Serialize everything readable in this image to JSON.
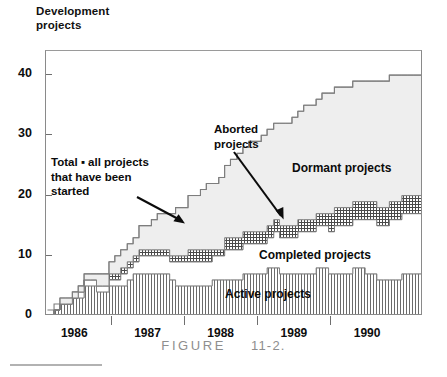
{
  "axis_title": "Development\nprojects",
  "caption": {
    "word": "FIGURE",
    "number": "11-2."
  },
  "annotations": {
    "total": "Total ▪ all projects\nthat have been\nstarted",
    "aborted": "Aborted\nprojects",
    "dormant": "Dormant projects",
    "completed": "Completed projects",
    "active": "Active projects"
  },
  "colors": {
    "dormant_fill": "#eeeeee",
    "aborted_fill": "#9a9a9a",
    "completed_fill": "#ffffff",
    "active_fill": "#d9d9d9",
    "line": "#7d7d7d",
    "text": "#0d0d0d",
    "caption": "#8e8e8e"
  },
  "chart_data": {
    "type": "area",
    "title": "Development projects",
    "xlabel": "",
    "ylabel": "Development projects",
    "ylim": [
      0,
      44
    ],
    "xlim": [
      1985.6,
      1990.75
    ],
    "grid": false,
    "legend_position": "inline-annotations",
    "stacking": "cumulative",
    "yticks": [
      0,
      10,
      20,
      30,
      40
    ],
    "ytick_labels": [
      "0",
      "10",
      "20",
      "30",
      "40"
    ],
    "xticks": [
      1986.5,
      1987.5,
      1988.5,
      1989.5
    ],
    "xtick_labels": [
      "1986",
      "1987",
      "1988",
      "1989",
      "1990"
    ],
    "xtick_label_positions": [
      1986.0,
      1987.0,
      1988.0,
      1989.0,
      1990.0
    ],
    "x": [
      1985.62,
      1985.71,
      1985.79,
      1985.87,
      1985.96,
      1986.04,
      1986.12,
      1986.21,
      1986.29,
      1986.37,
      1986.46,
      1986.54,
      1986.62,
      1986.71,
      1986.79,
      1986.87,
      1986.96,
      1987.04,
      1987.12,
      1987.21,
      1987.29,
      1987.37,
      1987.46,
      1987.54,
      1987.62,
      1987.71,
      1987.79,
      1987.87,
      1987.96,
      1988.04,
      1988.12,
      1988.21,
      1988.29,
      1988.37,
      1988.46,
      1988.54,
      1988.62,
      1988.71,
      1988.79,
      1988.87,
      1988.96,
      1989.04,
      1989.12,
      1989.21,
      1989.29,
      1989.37,
      1989.46,
      1989.54,
      1989.62,
      1989.71,
      1989.79,
      1989.87,
      1989.96,
      1990.04,
      1990.12,
      1990.21,
      1990.29,
      1990.37,
      1990.46,
      1990.54,
      1990.62,
      1990.71
    ],
    "series": [
      {
        "name": "Active projects",
        "pattern": "vertical-hatch",
        "values": [
          0,
          1,
          2,
          2,
          3,
          3,
          5,
          5,
          4,
          4,
          5,
          5,
          5,
          6,
          7,
          7,
          7,
          7,
          7,
          7,
          6,
          5,
          5,
          5,
          5,
          5,
          5,
          6,
          6,
          6,
          6,
          6,
          7,
          7,
          7,
          7,
          8,
          8,
          7,
          7,
          7,
          7,
          7,
          7,
          8,
          8,
          7,
          7,
          7,
          7,
          8,
          8,
          7,
          7,
          6,
          6,
          6,
          6,
          7,
          7,
          7,
          7
        ]
      },
      {
        "name": "Completed projects",
        "pattern": "solid-white",
        "values": [
          0,
          0,
          0,
          0,
          0,
          1,
          1,
          1,
          1,
          1,
          1,
          1,
          2,
          2,
          2,
          3,
          3,
          3,
          3,
          3,
          3,
          4,
          4,
          4,
          4,
          4,
          4,
          4,
          4,
          5,
          5,
          5,
          5,
          5,
          5,
          5,
          5,
          6,
          6,
          6,
          6,
          7,
          7,
          7,
          7,
          7,
          7,
          8,
          8,
          8,
          8,
          8,
          9,
          9,
          9,
          9,
          10,
          10,
          10,
          10,
          10,
          10
        ]
      },
      {
        "name": "Aborted projects",
        "pattern": "cross-hatch",
        "values": [
          0,
          0,
          0,
          0,
          0,
          0,
          0,
          0,
          0,
          0,
          1,
          1,
          1,
          1,
          1,
          1,
          1,
          1,
          1,
          1,
          1,
          1,
          1,
          2,
          2,
          2,
          2,
          1,
          1,
          2,
          2,
          2,
          2,
          2,
          2,
          2,
          2,
          2,
          2,
          2,
          2,
          2,
          2,
          2,
          2,
          2,
          3,
          3,
          3,
          3,
          3,
          3,
          3,
          3,
          3,
          3,
          3,
          3,
          3,
          3,
          3,
          3
        ]
      },
      {
        "name": "Dormant projects",
        "pattern": "light-gray",
        "values": [
          0,
          0,
          1,
          1,
          1,
          1,
          1,
          1,
          2,
          2,
          2,
          3,
          3,
          3,
          3,
          4,
          4,
          5,
          6,
          6,
          7,
          8,
          8,
          9,
          9,
          10,
          11,
          11,
          12,
          12,
          13,
          14,
          14,
          15,
          15,
          16,
          16,
          16,
          17,
          17,
          18,
          18,
          19,
          19,
          19,
          20,
          20,
          20,
          20,
          20,
          20,
          20,
          20,
          20,
          21,
          21,
          21,
          21,
          20,
          20,
          20,
          20
        ]
      }
    ],
    "total_line": {
      "name": "Total = all projects that have been started",
      "values": [
        1,
        2,
        3,
        3,
        4,
        5,
        7,
        7,
        7,
        7,
        9,
        10,
        11,
        12,
        13,
        15,
        15,
        16,
        17,
        17,
        17,
        18,
        18,
        20,
        20,
        21,
        22,
        22,
        23,
        25,
        26,
        27,
        28,
        29,
        29,
        30,
        31,
        32,
        32,
        32,
        33,
        34,
        35,
        35,
        36,
        37,
        37,
        38,
        38,
        38,
        39,
        39,
        39,
        39,
        39,
        39,
        40,
        40,
        40,
        40,
        40,
        40
      ]
    }
  }
}
